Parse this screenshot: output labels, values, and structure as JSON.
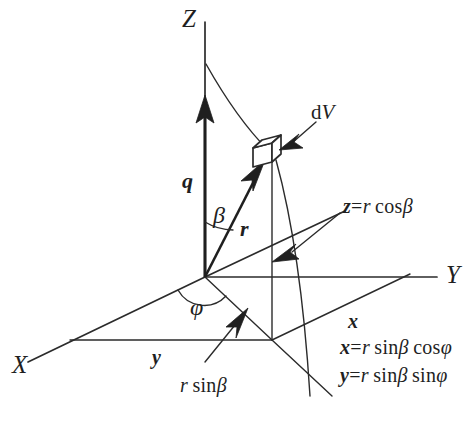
{
  "figure": {
    "name": "spherical-polar-coordinates",
    "background_color": "#ffffff",
    "ink_color": "#1f1f1f",
    "axes": {
      "z_label": "Z",
      "y_label": "Y",
      "x_label": "X"
    },
    "vectors": {
      "q_label": "q",
      "r_label": "r"
    },
    "angles": {
      "beta_label": "β",
      "phi_label": "φ"
    },
    "components": {
      "x_label": "x",
      "y_label": "y"
    },
    "callouts": {
      "volume_element": "dV",
      "volume_element_d": "d",
      "volume_element_v": "V",
      "z_component": "z = r cosβ",
      "z_component_lhs": "z",
      "z_component_eq": "=",
      "z_component_rhs_r": "r",
      "z_component_rhs_fn": "cos",
      "z_component_rhs_arg": "β",
      "projection": "r sinβ",
      "projection_r": "r",
      "projection_fn": "sin",
      "projection_arg": "β"
    },
    "equations": [
      {
        "id": "x-equation",
        "text": "x = r sinβ cosφ",
        "lhs": "x",
        "eq": "=",
        "r": "r",
        "fn1": "sin",
        "arg1": "β",
        "fn2": "cos",
        "arg2": "φ"
      },
      {
        "id": "y-equation",
        "text": "y = r sinβ sinφ",
        "lhs": "y",
        "eq": "=",
        "r": "r",
        "fn1": "sin",
        "arg1": "β",
        "fn2": "sin",
        "arg2": "φ"
      }
    ]
  }
}
